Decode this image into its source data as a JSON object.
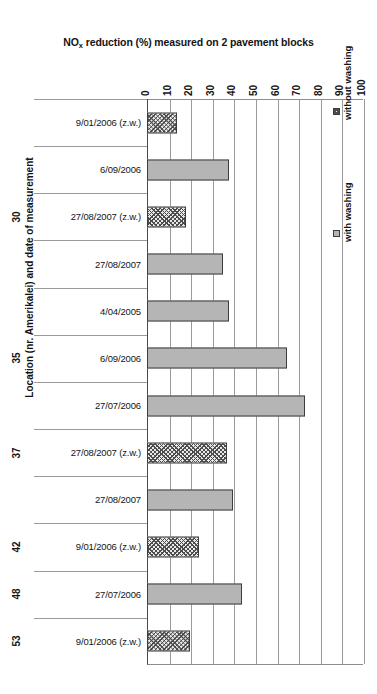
{
  "chart_data": {
    "type": "bar",
    "orientation": "horizontal",
    "title": "NO",
    "title_sub": "x",
    "title_rest": " reduction (%) measured on 2 pavement blocks",
    "title_full": "NOx reduction (%) measured on 2 pavement blocks",
    "xlabel": "",
    "ylabel": "Location (nr. Amerikalei) and date of measurement",
    "xlim": [
      0,
      100
    ],
    "xticks": [
      "0",
      "10",
      "20",
      "30",
      "40",
      "50",
      "60",
      "70",
      "80",
      "90",
      "100"
    ],
    "grid": true,
    "legend_position": "right",
    "legend": [
      {
        "label": "without washing",
        "key": "without-washing",
        "color": "#e9e9e9",
        "pattern": "crosshatch"
      },
      {
        "label": "with washing",
        "key": "with-washing",
        "color": "#b5b5b5",
        "pattern": "solid"
      }
    ],
    "categories": [
      {
        "group": "",
        "label": "9/01/2006 (z.w.)",
        "series": "without washing",
        "value": 14
      },
      {
        "group": "",
        "label": "6/09/2006",
        "series": "with washing",
        "value": 38
      },
      {
        "group": "30",
        "label": "27/08/2007 (z.w.)",
        "series": "without washing",
        "value": 18
      },
      {
        "group": "",
        "label": "27/08/2007",
        "series": "with washing",
        "value": 35
      },
      {
        "group": "",
        "label": "4/04/2005",
        "series": "with washing",
        "value": 38
      },
      {
        "group": "35",
        "label": "6/09/2006",
        "series": "with washing",
        "value": 65
      },
      {
        "group": "",
        "label": "27/07/2006",
        "series": "with washing",
        "value": 73
      },
      {
        "group": "37",
        "label": "27/08/2007 (z.w.)",
        "series": "without washing",
        "value": 37
      },
      {
        "group": "",
        "label": "27/08/2007",
        "series": "with washing",
        "value": 40
      },
      {
        "group": "42",
        "label": "9/01/2006 (z.w.)",
        "series": "without washing",
        "value": 24
      },
      {
        "group": "48",
        "label": "27/07/2006",
        "series": "with washing",
        "value": 44
      },
      {
        "group": "53",
        "label": "9/01/2006 (z.w.)",
        "series": "without washing",
        "value": 20
      }
    ]
  }
}
